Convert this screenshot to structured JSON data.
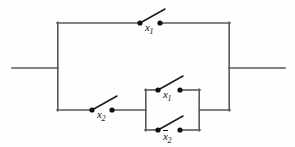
{
  "figure": {
    "name": "switching-circuit",
    "background_color": "#fefefe",
    "wire_color": "#58595b",
    "node_color": "#111111",
    "width": 295,
    "height": 147
  },
  "switches": [
    {
      "id": "top-branch-switch",
      "label_base": "x",
      "label_sub": "1",
      "complement": false,
      "label_text": "x1",
      "branch": "top-parallel-branch",
      "label_x": 145,
      "label_y": 22,
      "left_terminal": {
        "x": 140,
        "y": 23
      },
      "right_terminal": {
        "x": 160,
        "y": 23
      },
      "lever_end": {
        "x": 165,
        "y": 10
      }
    },
    {
      "id": "bottom-branch-switch",
      "label_base": "x",
      "label_sub": "2",
      "complement": false,
      "label_text": "x2",
      "branch": "bottom-series-branch",
      "label_x": 97,
      "label_y": 109,
      "left_terminal": {
        "x": 92,
        "y": 110
      },
      "right_terminal": {
        "x": 112,
        "y": 110
      },
      "lever_end": {
        "x": 117,
        "y": 97
      }
    },
    {
      "id": "inner-top-switch",
      "label_base": "x",
      "label_sub": "1",
      "complement": false,
      "label_text": "x1",
      "branch": "inner-parallel-top",
      "label_x": 163,
      "label_y": 89,
      "left_terminal": {
        "x": 158,
        "y": 90
      },
      "right_terminal": {
        "x": 180,
        "y": 90
      },
      "lever_end": {
        "x": 185,
        "y": 77
      }
    },
    {
      "id": "inner-bottom-switch",
      "label_base": "x",
      "label_sub": "2",
      "complement": true,
      "label_text": "x̄2",
      "branch": "inner-parallel-bottom",
      "label_x": 163,
      "label_y": 131,
      "left_terminal": {
        "x": 158,
        "y": 130
      },
      "right_terminal": {
        "x": 180,
        "y": 130
      },
      "lever_end": {
        "x": 185,
        "y": 117
      }
    }
  ],
  "geometry": {
    "left_lead": {
      "x1": 12,
      "y1": 68,
      "x2": 57,
      "y2": 68
    },
    "right_lead": {
      "x1": 230,
      "y1": 68,
      "x2": 285,
      "y2": 68
    },
    "left_rail": {
      "x": 57,
      "y_top": 23,
      "y_bottom": 110
    },
    "right_rail": {
      "x": 230,
      "y_top": 23,
      "y_bottom": 110
    },
    "top_rail_y": 23,
    "bottom_rail_y": 110,
    "inner_box": {
      "x_left": 145,
      "x_right": 200,
      "y_top": 90,
      "y_bottom": 130
    }
  }
}
